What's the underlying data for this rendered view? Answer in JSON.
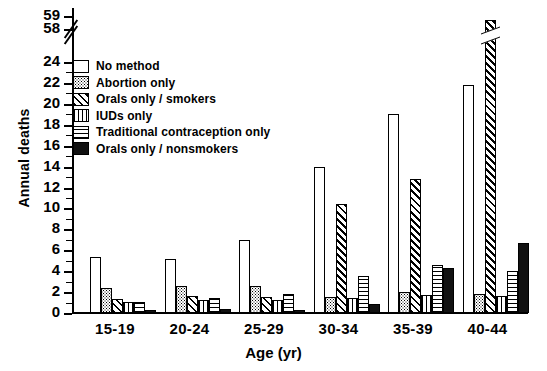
{
  "chart_data": {
    "type": "bar",
    "title": "",
    "xlabel": "Age (yr)",
    "ylabel": "Annual deaths",
    "categories": [
      "15-19",
      "20-24",
      "25-29",
      "30-34",
      "35-39",
      "40-44"
    ],
    "ylim": [
      0,
      24
    ],
    "yticks": [
      0,
      2,
      4,
      6,
      8,
      10,
      12,
      14,
      16,
      18,
      20,
      22,
      24
    ],
    "ytick_labels": [
      "0",
      "2",
      "4",
      "6",
      "8",
      "10",
      "12",
      "14",
      "16",
      "18",
      "20",
      "22",
      "24"
    ],
    "axis_break": {
      "after": 24,
      "resume_labels": [
        "58",
        "59"
      ]
    },
    "grid": false,
    "legend_position": "upper-left",
    "series": [
      {
        "name": "No method",
        "pattern": "open",
        "values": [
          5.4,
          5.2,
          7.0,
          14.0,
          19.0,
          21.8
        ]
      },
      {
        "name": "Abortion only",
        "pattern": "dotted",
        "values": [
          2.4,
          2.6,
          2.6,
          1.5,
          2.0,
          1.8
        ]
      },
      {
        "name": "Orals only / smokers",
        "pattern": "diagonal-hatch",
        "values": [
          1.3,
          1.6,
          1.5,
          10.4,
          12.8,
          58.5
        ]
      },
      {
        "name": "IUDs only",
        "pattern": "vertical-hatch",
        "values": [
          1.1,
          1.2,
          1.2,
          1.4,
          1.7,
          1.6
        ]
      },
      {
        "name": "Traditional contraception only",
        "pattern": "horizontal-hatch",
        "values": [
          1.1,
          1.4,
          1.8,
          3.5,
          4.6,
          4.0
        ]
      },
      {
        "name": "Orals only / nonsmokers",
        "pattern": "solid-black",
        "values": [
          0.25,
          0.4,
          0.3,
          0.9,
          4.3,
          6.7
        ]
      }
    ]
  },
  "legend": {
    "items": [
      {
        "label": "No method"
      },
      {
        "label": "Abortion only"
      },
      {
        "label": "Orals only / smokers"
      },
      {
        "label": "IUDs only"
      },
      {
        "label": "Traditional contraception only"
      },
      {
        "label": "Orals only / nonsmokers"
      }
    ]
  },
  "axis": {
    "y_title": "Annual deaths",
    "x_title": "Age (yr)",
    "top_labels": [
      "59",
      "58"
    ]
  }
}
